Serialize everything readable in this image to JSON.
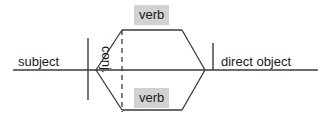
{
  "diagram": {
    "type": "reed-kellogg-sentence-diagram",
    "baseline": {
      "x1": 13,
      "x2": 318,
      "y": 70
    },
    "colors": {
      "line": "#3a3a3a",
      "text": "#1a1a1a",
      "highlight": "#d2d2d2",
      "background": "#ffffff"
    },
    "labels": {
      "subject": "subject",
      "verb_top": "verb",
      "verb_bottom": "verb",
      "conjunction": "conj.",
      "direct_object": "direct object"
    },
    "dividers": {
      "subject_divider": {
        "x": 88,
        "y1": 38,
        "y2": 100
      },
      "direct_object_divider": {
        "x": 213,
        "y1": 43,
        "y2": 70
      }
    },
    "hexagon": {
      "left_vertex": {
        "x": 96,
        "y": 70
      },
      "top_left": {
        "x": 122,
        "y": 30
      },
      "top_right": {
        "x": 182,
        "y": 30
      },
      "right_vertex": {
        "x": 205,
        "y": 70
      },
      "bottom_right": {
        "x": 182,
        "y": 110
      },
      "bottom_left": {
        "x": 122,
        "y": 110
      }
    },
    "conjunction_line": {
      "x": 122,
      "y1": 30,
      "y2": 112,
      "style": "dashed"
    }
  }
}
